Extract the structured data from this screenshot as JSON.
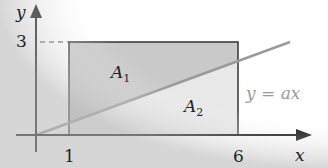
{
  "diagram": {
    "axes": {
      "x_label": "x",
      "y_label": "y",
      "x_ticks": [
        "1",
        "6"
      ],
      "y_ticks": [
        "3"
      ]
    },
    "regions": [
      {
        "name": "A",
        "subscript": "1",
        "fill": "#c8c8c8"
      },
      {
        "name": "A",
        "subscript": "2",
        "fill": "#e6e6e6"
      }
    ],
    "line": {
      "label": "y = ax",
      "color": "#9a9a9a"
    },
    "colors": {
      "axis": "#111111",
      "rect_border": "#333333",
      "dashed": "#333333"
    }
  }
}
